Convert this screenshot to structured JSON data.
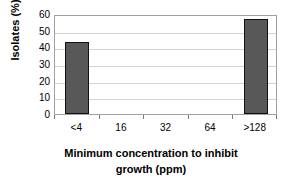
{
  "chart_data": {
    "type": "bar",
    "title": "",
    "subtitle": "",
    "categories": [
      "<4",
      "16",
      "32",
      "64",
      ">128"
    ],
    "values": [
      43,
      0,
      0,
      0,
      57
    ],
    "series": [
      {
        "name": "Isolates",
        "values": [
          43,
          0,
          0,
          0,
          57
        ]
      }
    ],
    "xlabel": "Minimum concentration to inhibit growth (ppm)",
    "xlabel_lines": [
      "Minimum concentration to inhibit",
      "growth (ppm)"
    ],
    "ylabel": "Isolates (%)",
    "ylim": [
      0,
      60
    ],
    "yticks": [
      0,
      10,
      20,
      30,
      40,
      50,
      60
    ],
    "ytick_labels": [
      "0",
      "10",
      "20",
      "30",
      "40",
      "50",
      "60"
    ],
    "grid": true,
    "grid_axis": "y",
    "legend": false,
    "legend_position": "none",
    "bar_color": "#585858",
    "bar_border_color": "#111111",
    "gridline_color": "#d4d4d4",
    "plot_border_color": "#a0a0a0",
    "background_color": "#ffffff",
    "annotations": []
  }
}
